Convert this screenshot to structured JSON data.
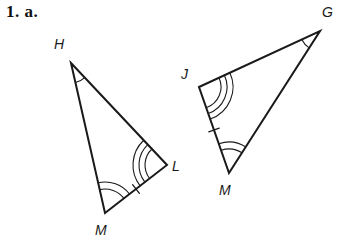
{
  "problem": {
    "label": "1. a.",
    "figure_type": "two-congruent-triangles-diagram"
  },
  "colors": {
    "stroke": "#1a1a1a",
    "background": "#ffffff",
    "label": "#1a1a1a"
  },
  "figure": {
    "stroke_width": 2.0,
    "mark_stroke_width": 1.1,
    "triangles": [
      {
        "name": "triangle-HML",
        "vertices": [
          {
            "id": "H",
            "label": "H",
            "x": 71,
            "y": 63,
            "label_x": 54,
            "label_y": 36,
            "angle_arcs": 1,
            "arc_base_radius": 20,
            "arc_gap": 5
          },
          {
            "id": "L",
            "label": "L",
            "x": 167,
            "y": 165,
            "label_x": 172,
            "label_y": 158,
            "angle_arcs": 3,
            "arc_base_radius": 22,
            "arc_gap": 6
          },
          {
            "id": "M",
            "label": "M",
            "x": 105,
            "y": 213,
            "label_x": 95,
            "label_y": 222,
            "angle_arcs": 2,
            "arc_base_radius": 24,
            "arc_gap": 7
          }
        ],
        "sides": [
          {
            "id": "HL",
            "from": "H",
            "to": "L",
            "ticks": 0
          },
          {
            "id": "LM",
            "from": "L",
            "to": "M",
            "ticks": 1
          },
          {
            "id": "MH",
            "from": "M",
            "to": "H",
            "ticks": 0
          }
        ]
      },
      {
        "name": "triangle-JGM",
        "vertices": [
          {
            "id": "J",
            "label": "J",
            "x": 199,
            "y": 87,
            "label_x": 181,
            "label_y": 66,
            "angle_arcs": 3,
            "arc_base_radius": 22,
            "arc_gap": 6
          },
          {
            "id": "G",
            "label": "G",
            "x": 320,
            "y": 31,
            "label_x": 322,
            "label_y": 4,
            "angle_arcs": 1,
            "arc_base_radius": 20,
            "arc_gap": 5
          },
          {
            "id": "M2",
            "label": "M",
            "x": 229,
            "y": 173,
            "label_x": 219,
            "label_y": 182,
            "angle_arcs": 2,
            "arc_base_radius": 24,
            "arc_gap": 7
          }
        ],
        "sides": [
          {
            "id": "JG",
            "from": "J",
            "to": "G",
            "ticks": 0
          },
          {
            "id": "GM",
            "from": "G",
            "to": "M2",
            "ticks": 0
          },
          {
            "id": "MJ",
            "from": "M2",
            "to": "J",
            "ticks": 1
          }
        ]
      }
    ]
  }
}
